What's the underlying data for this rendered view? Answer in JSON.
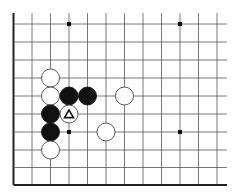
{
  "board": {
    "background": "#ffffff",
    "line_color": "#555555",
    "edge_color": "#222222",
    "columns_x": [
      13.5,
      32,
      50.5,
      69,
      87.5,
      106,
      124.5,
      143,
      161.5,
      180,
      198.5,
      217
    ],
    "rows_y": [
      24,
      42,
      60,
      78,
      96,
      114,
      132,
      150,
      167.5,
      185
    ],
    "line_extent": {
      "top": 13,
      "right": 227
    },
    "edges": [
      "left",
      "bottom"
    ],
    "star_points": [
      {
        "x": 69,
        "y": 24
      },
      {
        "x": 180,
        "y": 24
      },
      {
        "x": 69,
        "y": 132
      },
      {
        "x": 180,
        "y": 132
      }
    ],
    "stone_radius": 9,
    "stones": [
      {
        "color": "white",
        "x": 50.5,
        "y": 78
      },
      {
        "color": "white",
        "x": 50.5,
        "y": 96
      },
      {
        "color": "black",
        "x": 69,
        "y": 96
      },
      {
        "color": "black",
        "x": 87.5,
        "y": 96
      },
      {
        "color": "white",
        "x": 124.5,
        "y": 96
      },
      {
        "color": "black",
        "x": 50.5,
        "y": 114
      },
      {
        "color": "white",
        "x": 69,
        "y": 114,
        "marker": "triangle"
      },
      {
        "color": "black",
        "x": 50.5,
        "y": 132
      },
      {
        "color": "white",
        "x": 106,
        "y": 132
      },
      {
        "color": "white",
        "x": 50.5,
        "y": 150
      }
    ]
  }
}
